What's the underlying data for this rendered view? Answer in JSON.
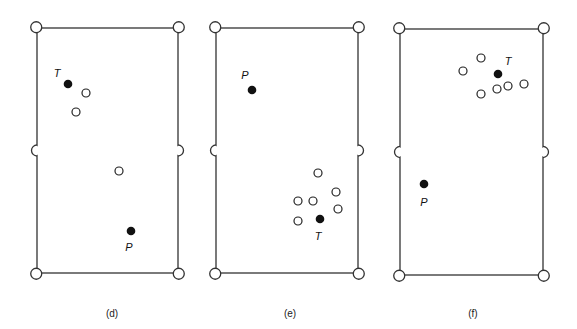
{
  "figure": {
    "panels": [
      {
        "id": "d",
        "caption": "(d)",
        "caption_pos": [
          112,
          317
        ],
        "table": {
          "x1": 37,
          "y1": 28,
          "x2": 178,
          "y2": 273
        },
        "pocket_radius": 5.5,
        "target_ball": {
          "label": "T",
          "x": 68,
          "y": 84,
          "label_x": 57,
          "label_y": 77
        },
        "player_ball": {
          "label": "P",
          "x": 131,
          "y": 231,
          "label_x": 129,
          "label_y": 251
        },
        "open_balls": [
          {
            "x": 86,
            "y": 93
          },
          {
            "x": 76,
            "y": 112
          },
          {
            "x": 119,
            "y": 171
          }
        ]
      },
      {
        "id": "e",
        "caption": "(e)",
        "caption_pos": [
          290,
          317
        ],
        "table": {
          "x1": 216,
          "y1": 28,
          "x2": 358,
          "y2": 273
        },
        "pocket_radius": 5.5,
        "target_ball": {
          "label": "T",
          "x": 320,
          "y": 219,
          "label_x": 318,
          "label_y": 240
        },
        "player_ball": {
          "label": "P",
          "x": 252,
          "y": 90,
          "label_x": 245,
          "label_y": 79
        },
        "open_balls": [
          {
            "x": 318,
            "y": 173
          },
          {
            "x": 336,
            "y": 192
          },
          {
            "x": 298,
            "y": 201
          },
          {
            "x": 313,
            "y": 201
          },
          {
            "x": 338,
            "y": 209
          },
          {
            "x": 298,
            "y": 221
          }
        ]
      },
      {
        "id": "f",
        "caption": "(f)",
        "caption_pos": [
          473,
          317
        ],
        "table": {
          "x1": 400,
          "y1": 29,
          "x2": 543,
          "y2": 275
        },
        "pocket_radius": 5.5,
        "target_ball": {
          "label": "T",
          "x": 498,
          "y": 74,
          "label_x": 508,
          "label_y": 65
        },
        "player_ball": {
          "label": "P",
          "x": 424,
          "y": 184,
          "label_x": 424,
          "label_y": 206
        },
        "open_balls": [
          {
            "x": 481,
            "y": 58
          },
          {
            "x": 463,
            "y": 71
          },
          {
            "x": 497,
            "y": 89
          },
          {
            "x": 508,
            "y": 86
          },
          {
            "x": 524,
            "y": 84
          },
          {
            "x": 481,
            "y": 94
          }
        ]
      }
    ],
    "ball_radius": 4,
    "legend": {
      "solid_ball_meaning": "labeled balls T (target) and P",
      "open_ball_meaning": "other balls"
    }
  }
}
